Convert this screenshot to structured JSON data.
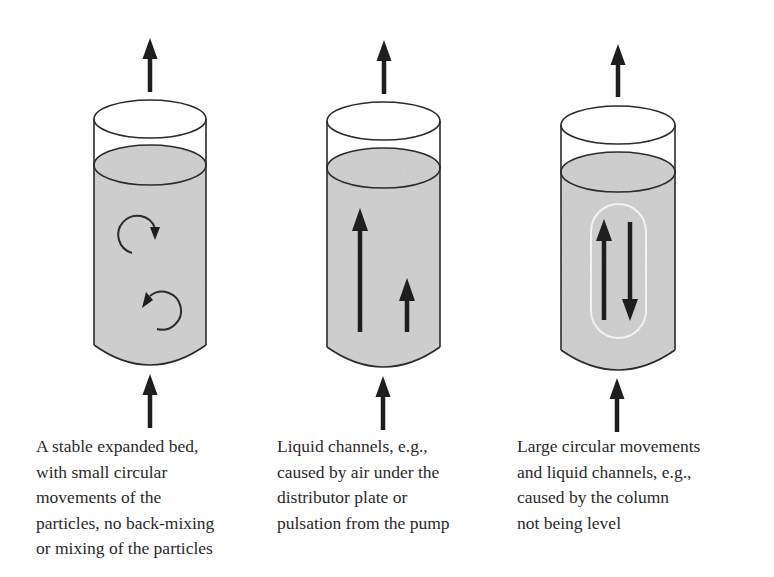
{
  "diagram": {
    "colors": {
      "background": "#ffffff",
      "outline": "#2b2b2b",
      "liquid_fill": "#c8c8c8",
      "arrow": "#1e1e1e",
      "channel_loop": "#f2f2f2",
      "text": "#2a2a2a"
    },
    "panels": [
      {
        "id": "stable-bed",
        "flow_in_arrow": "arrow-up-icon",
        "flow_out_arrow": "arrow-up-icon",
        "inner_icons": [
          "clockwise-circular-arrow-icon",
          "counterclockwise-circular-arrow-icon"
        ],
        "caption_lines": [
          "A stable expanded bed,",
          "with small circular",
          "movements of the",
          "particles, no back-mixing",
          "or mixing of the particles"
        ]
      },
      {
        "id": "liquid-channels",
        "flow_in_arrow": "arrow-up-icon",
        "flow_out_arrow": "arrow-up-icon",
        "inner_icons": [
          "long-arrow-up-icon",
          "short-arrow-up-icon"
        ],
        "caption_lines": [
          "Liquid channels, e.g.,",
          "caused by air under the",
          "distributor plate or",
          "pulsation from the pump"
        ]
      },
      {
        "id": "large-circular-movements",
        "flow_in_arrow": "arrow-up-icon",
        "flow_out_arrow": "arrow-up-icon",
        "inner_icons": [
          "arrow-up-icon",
          "arrow-down-icon",
          "circulation-loop-outline"
        ],
        "caption_lines": [
          "Large circular movements",
          "and liquid channels, e.g.,",
          "caused by the column",
          "not being level"
        ]
      }
    ]
  }
}
